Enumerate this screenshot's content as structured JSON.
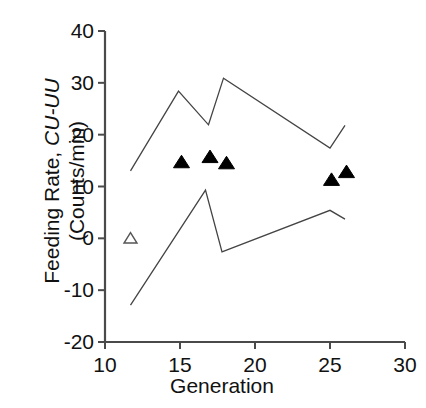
{
  "chart_data": {
    "type": "line",
    "title": "",
    "xlabel": "Generation",
    "ylabel": "Feeding Rate, CU-UU (Counts/min)",
    "ylabel_parts": {
      "plain": "Feeding Rate, ",
      "italic": "CU-UU",
      "line2": "(Counts/min)"
    },
    "xlim": [
      10,
      30
    ],
    "ylim": [
      -20,
      40
    ],
    "xticks": [
      10,
      15,
      20,
      25,
      30
    ],
    "yticks": [
      40,
      30,
      20,
      10,
      0,
      -10,
      -20
    ],
    "xtick_labels": [
      "10",
      "15",
      "20",
      "25",
      "30"
    ],
    "ytick_labels": [
      "40",
      "30",
      "20",
      "10",
      "0",
      "-10",
      "-20"
    ],
    "grid": false,
    "legend": "none",
    "series": [
      {
        "name": "upper-confidence-envelope",
        "type": "line",
        "style": "solid-thin",
        "color": "#444444",
        "points": [
          {
            "x": 11.7,
            "y": 13.0
          },
          {
            "x": 14.9,
            "y": 28.4
          },
          {
            "x": 16.9,
            "y": 21.9
          },
          {
            "x": 17.9,
            "y": 30.9
          },
          {
            "x": 25.0,
            "y": 17.4
          },
          {
            "x": 26.0,
            "y": 21.8
          }
        ]
      },
      {
        "name": "lower-confidence-envelope",
        "type": "line",
        "style": "solid-thin",
        "color": "#444444",
        "points": [
          {
            "x": 11.7,
            "y": -12.9
          },
          {
            "x": 16.7,
            "y": 9.3
          },
          {
            "x": 17.8,
            "y": -2.6
          },
          {
            "x": 25.0,
            "y": 5.4
          },
          {
            "x": 26.0,
            "y": 3.7
          }
        ]
      },
      {
        "name": "feeding-rate-filled-markers",
        "type": "scatter",
        "marker": "filled-triangle-up",
        "color": "#000000",
        "points": [
          {
            "x": 15.1,
            "y": 14.7
          },
          {
            "x": 17.0,
            "y": 15.7
          },
          {
            "x": 18.1,
            "y": 14.5
          },
          {
            "x": 25.1,
            "y": 11.3
          },
          {
            "x": 26.1,
            "y": 12.8
          }
        ]
      },
      {
        "name": "feeding-rate-open-marker",
        "type": "scatter",
        "marker": "open-triangle-up",
        "color": "#555555",
        "points": [
          {
            "x": 11.7,
            "y": 0.0
          }
        ]
      }
    ]
  },
  "axis": {
    "x_axis_name": "x-axis",
    "y_axis_name": "y-axis"
  }
}
